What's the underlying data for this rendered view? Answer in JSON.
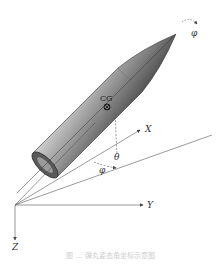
{
  "diagram": {
    "labels": {
      "cg": "CG",
      "x_axis": "X",
      "y_axis": "Y",
      "z_axis": "Z",
      "theta": "θ",
      "psi": "φ",
      "roll_tip": "φ"
    },
    "colors": {
      "body_dark": "#3a3a3a",
      "body_mid": "#8a8a8a",
      "body_light": "#c8c8c8",
      "lines": "#555555",
      "background": "#ffffff"
    }
  },
  "caption": "图 ... 弹丸姿态角坐标示意图"
}
